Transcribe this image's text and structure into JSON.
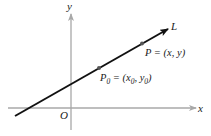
{
  "figure": {
    "type": "line-through-point-diagram",
    "axes": {
      "x_label": "x",
      "y_label": "y",
      "origin_label": "O",
      "axis_color": "#a8a8a8"
    },
    "line": {
      "label": "L",
      "color": "#111111"
    },
    "points": [
      {
        "name": "P0",
        "label_main": "P",
        "label_sub": "0",
        "label_rest": " = (x",
        "sub_x": "0",
        "mid": ", y",
        "sub_y": "0",
        "close": ")"
      },
      {
        "name": "P",
        "label": "P = (x, y)"
      }
    ],
    "point_color": "#555555"
  }
}
